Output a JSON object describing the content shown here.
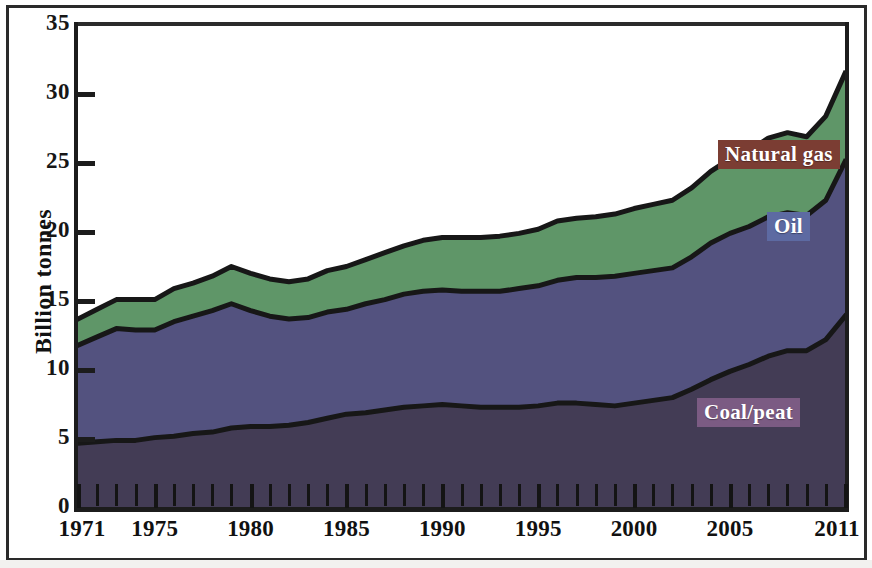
{
  "chart_data": {
    "type": "area",
    "stacked": true,
    "title": "",
    "subtitle": "",
    "xlabel": "",
    "ylabel": "Billion tonnes",
    "xlim": [
      1971,
      2011
    ],
    "ylim": [
      0,
      35
    ],
    "ytick_values": [
      0,
      5,
      10,
      15,
      20,
      25,
      30,
      35
    ],
    "ytick_labels": [
      "0",
      "5",
      "10",
      "15",
      "20",
      "25",
      "30",
      "35"
    ],
    "xtick_labels": [
      "1971",
      "1975",
      "1980",
      "1985",
      "1990",
      "1995",
      "2000",
      "2005",
      "2011"
    ],
    "xtick_values": [
      1971,
      1975,
      1980,
      1985,
      1990,
      1995,
      2000,
      2005,
      2011
    ],
    "xtick_minor_step": 1,
    "grid": false,
    "legend_position": "inline-annotations",
    "x": [
      1971,
      1972,
      1973,
      1974,
      1975,
      1976,
      1977,
      1978,
      1979,
      1980,
      1981,
      1982,
      1983,
      1984,
      1985,
      1986,
      1987,
      1988,
      1989,
      1990,
      1991,
      1992,
      1993,
      1994,
      1995,
      1996,
      1997,
      1998,
      1999,
      2000,
      2001,
      2002,
      2003,
      2004,
      2005,
      2006,
      2007,
      2008,
      2009,
      2010,
      2011
    ],
    "series": [
      {
        "name": "Coal/peat",
        "color": "#433c55",
        "label_bg": "#7b5b83",
        "values": [
          4.7,
          4.8,
          4.9,
          4.9,
          5.1,
          5.2,
          5.4,
          5.5,
          5.8,
          5.9,
          5.9,
          6.0,
          6.2,
          6.5,
          6.8,
          6.9,
          7.1,
          7.3,
          7.4,
          7.5,
          7.4,
          7.3,
          7.3,
          7.3,
          7.4,
          7.6,
          7.6,
          7.5,
          7.4,
          7.6,
          7.8,
          8.0,
          8.6,
          9.3,
          9.9,
          10.4,
          11.0,
          11.4,
          11.4,
          12.2,
          13.0
        ],
        "end_value": 13.9
      },
      {
        "name": "Oil",
        "color": "#53527f",
        "label_bg": "#5d6aa2",
        "values": [
          7.1,
          7.6,
          8.1,
          8.0,
          7.8,
          8.3,
          8.5,
          8.8,
          9.0,
          8.4,
          8.0,
          7.7,
          7.6,
          7.7,
          7.6,
          7.9,
          8.0,
          8.2,
          8.3,
          8.3,
          8.3,
          8.4,
          8.4,
          8.6,
          8.7,
          8.9,
          9.1,
          9.2,
          9.4,
          9.4,
          9.4,
          9.4,
          9.6,
          9.9,
          10.0,
          10.0,
          10.1,
          10.0,
          9.8,
          10.1,
          11.2
        ],
        "end_value": 11.2
      },
      {
        "name": "Natural gas",
        "color": "#5f9668",
        "label_bg": "#7b3d33",
        "values": [
          1.9,
          2.0,
          2.1,
          2.2,
          2.2,
          2.4,
          2.4,
          2.5,
          2.7,
          2.7,
          2.7,
          2.7,
          2.8,
          3.0,
          3.1,
          3.2,
          3.4,
          3.5,
          3.7,
          3.8,
          3.9,
          3.9,
          4.0,
          4.0,
          4.1,
          4.3,
          4.3,
          4.4,
          4.5,
          4.7,
          4.8,
          4.9,
          5.0,
          5.2,
          5.4,
          5.5,
          5.7,
          5.8,
          5.7,
          6.1,
          6.4
        ],
        "end_value": 6.4
      }
    ],
    "totals": [
      13.7,
      14.4,
      15.1,
      15.1,
      15.1,
      15.9,
      16.3,
      16.8,
      17.5,
      17.0,
      16.6,
      16.4,
      16.6,
      17.2,
      17.5,
      18.0,
      18.5,
      19.0,
      19.4,
      19.6,
      19.6,
      19.6,
      19.7,
      19.9,
      20.2,
      20.8,
      21.0,
      21.1,
      21.3,
      21.7,
      22.0,
      22.3,
      23.2,
      24.4,
      25.3,
      25.9,
      26.8,
      27.2,
      26.9,
      28.4,
      30.6
    ]
  },
  "axis": {
    "y_title": "Billion tonnes"
  },
  "annotations": {
    "natural_gas": "Natural gas",
    "oil": "Oil",
    "coal_peat": "Coal/peat"
  },
  "colors": {
    "coal": "#433c55",
    "oil": "#53527f",
    "gas": "#5f9668",
    "outline": "#171717",
    "label_gas_bg": "#7b3d33",
    "label_oil_bg": "#5d6aa2",
    "label_coal_bg": "#7b5b83",
    "axis": "#1c1c1c",
    "background": "#ffffff"
  }
}
